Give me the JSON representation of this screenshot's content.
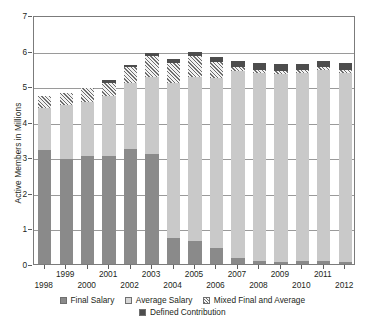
{
  "chart_data": {
    "type": "bar",
    "stacked": true,
    "title": "",
    "xlabel": "",
    "ylabel": "Active Members in Millions",
    "ylim": [
      0,
      7
    ],
    "yticks": [
      0,
      1,
      2,
      3,
      4,
      5,
      6,
      7
    ],
    "ytick_labels": [
      "0",
      "1",
      "2",
      "3",
      "4",
      "5",
      "6",
      "7"
    ],
    "grid": true,
    "grid_axis": "y",
    "legend_position": "bottom",
    "categories": [
      "1998",
      "1999",
      "2000",
      "2001",
      "2002",
      "2003",
      "2004",
      "2005",
      "2006",
      "2007",
      "2008",
      "2009",
      "2010",
      "2011",
      "2012"
    ],
    "series": [
      {
        "name": "Final Salary",
        "color": "#8a8a8a",
        "pattern": "solid",
        "values": [
          3.2,
          2.95,
          3.05,
          3.03,
          3.22,
          3.08,
          0.72,
          0.66,
          0.45,
          0.18,
          0.08,
          0.07,
          0.08,
          0.08,
          0.07
        ]
      },
      {
        "name": "Average Salary",
        "color": "#c9c9c9",
        "pattern": "solid",
        "values": [
          1.18,
          1.53,
          1.5,
          1.69,
          1.88,
          2.17,
          4.38,
          4.6,
          4.78,
          5.26,
          5.3,
          5.28,
          5.3,
          5.38,
          5.3
        ]
      },
      {
        "name": "Mixed Final and Average",
        "color": "#6e6e6e",
        "pattern": "diagonal-hatch",
        "values": [
          0.34,
          0.32,
          0.4,
          0.37,
          0.44,
          0.59,
          0.55,
          0.58,
          0.45,
          0.1,
          0.08,
          0.08,
          0.08,
          0.08,
          0.08
        ]
      },
      {
        "name": "Defined Contribution",
        "color": "#4d4d4d",
        "pattern": "solid",
        "values": [
          0.0,
          0.0,
          0.0,
          0.08,
          0.06,
          0.08,
          0.1,
          0.11,
          0.13,
          0.17,
          0.2,
          0.2,
          0.16,
          0.18,
          0.19
        ]
      }
    ],
    "totals": [
      4.72,
      4.8,
      4.95,
      5.17,
      5.6,
      5.92,
      5.75,
      5.95,
      5.81,
      5.71,
      5.66,
      5.63,
      5.62,
      5.72,
      5.64
    ]
  },
  "axis": {
    "y_title": "Active Members in Millions",
    "y_tick_labels": [
      "7",
      "6",
      "5",
      "4",
      "3",
      "2",
      "1",
      "0"
    ],
    "x_tick_labels": [
      "1998",
      "1999",
      "2000",
      "2001",
      "2002",
      "2003",
      "2004",
      "2005",
      "2006",
      "2007",
      "2008",
      "2009",
      "2010",
      "2011",
      "2012"
    ]
  },
  "legend": {
    "row1": [
      {
        "label": "Final Salary",
        "swatch": "final-salary-swatch"
      },
      {
        "label": "Average Salary",
        "swatch": "average-salary-swatch"
      },
      {
        "label": "Mixed Final and Average",
        "swatch": "mixed-final-average-swatch"
      }
    ],
    "row2": [
      {
        "label": "Defined Contribution",
        "swatch": "defined-contribution-swatch"
      }
    ]
  },
  "colors": {
    "final_salary": "#8a8a8a",
    "average_salary": "#c9c9c9",
    "mixed": "#6e6e6e",
    "defined_contribution": "#4d4d4d",
    "grid": "#9a9a9a",
    "frame": "#7b7b7b",
    "text": "#231f20"
  }
}
